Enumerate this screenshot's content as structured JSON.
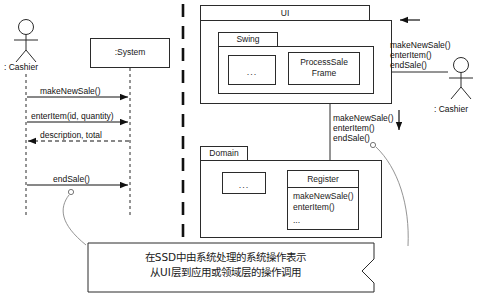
{
  "diagram": {
    "type": "uml-interaction-overview",
    "left_panel": {
      "title_actor": ": Cashier",
      "system_box": ":System",
      "messages": [
        {
          "label": "makeNewSale()",
          "direction": "right",
          "style": "solid"
        },
        {
          "label": "enterItem(id, quantity)",
          "direction": "right",
          "style": "solid"
        },
        {
          "label": "description, total",
          "direction": "left",
          "style": "dashed"
        },
        {
          "label": "endSale()",
          "direction": "right",
          "style": "solid"
        }
      ]
    },
    "right_panel": {
      "ui_package": {
        "name": "UI",
        "sub_package": {
          "name": "Swing",
          "placeholder": "...",
          "frame": "ProcessSale\nFrame"
        }
      },
      "domain_package": {
        "name": "Domain",
        "placeholder": "...",
        "class": {
          "name": "Register",
          "operations": "makeNewSale()\nenterItem()",
          "more": "..."
        }
      },
      "actor": ": Cashier",
      "actor_messages": "makeNewSale()\nenterItem()\nendSale()",
      "layer_messages": "makeNewSale()\nenterItem()\nendSale()"
    },
    "callout": {
      "line1": "在SSD中由系统处理的系统操作表示",
      "line2": "从UI层到应用或领域层的操作调用"
    },
    "colors": {
      "stroke": "#2b2b2b",
      "text": "#111111",
      "background": "#ffffff"
    }
  }
}
